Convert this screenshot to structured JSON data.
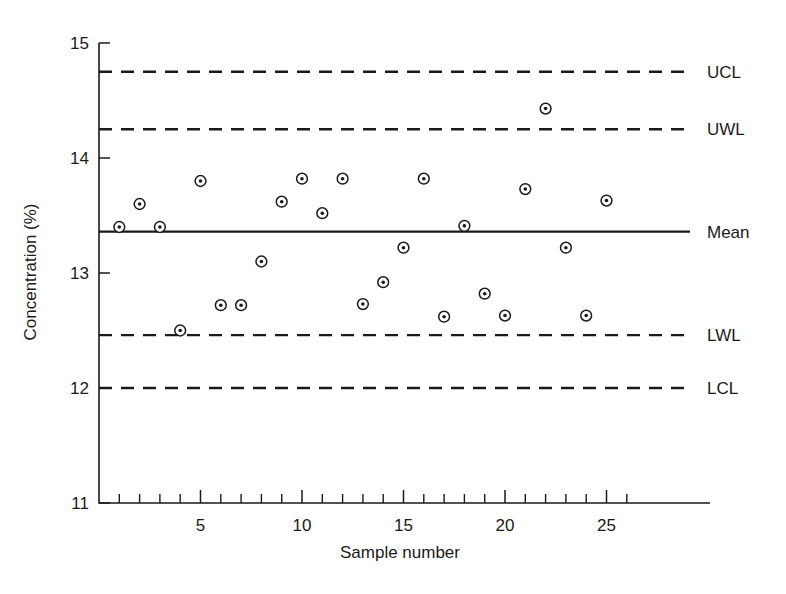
{
  "chart_data": {
    "type": "scatter",
    "title": "",
    "xlabel": "Sample number",
    "ylabel": "Concentration (%)",
    "xlim": [
      0,
      26
    ],
    "ylim": [
      11,
      15
    ],
    "xticks": [
      5,
      10,
      15,
      20,
      25
    ],
    "xtick_labels": [
      "5",
      "10",
      "15",
      "20",
      "25"
    ],
    "x_minor_tick_step": 1,
    "yticks": [
      11,
      12,
      13,
      14,
      15
    ],
    "ytick_labels": [
      "11",
      "12",
      "13",
      "14",
      "15"
    ],
    "grid": false,
    "legend": "none",
    "x": [
      1,
      2,
      3,
      4,
      5,
      6,
      7,
      8,
      9,
      10,
      11,
      12,
      13,
      14,
      15,
      16,
      17,
      18,
      19,
      20,
      21,
      22,
      23,
      24,
      25
    ],
    "values": [
      13.4,
      13.6,
      13.4,
      12.5,
      13.8,
      12.72,
      12.72,
      13.1,
      13.62,
      13.82,
      13.52,
      13.82,
      12.73,
      12.92,
      13.22,
      13.82,
      12.62,
      13.41,
      12.82,
      12.63,
      13.73,
      14.43,
      13.22,
      12.63,
      13.63
    ],
    "marker": "circle-with-dot",
    "reference_lines": [
      {
        "name": "UCL",
        "label": "UCL",
        "value": 14.75,
        "style": "dashed"
      },
      {
        "name": "UWL",
        "label": "UWL",
        "value": 14.25,
        "style": "dashed"
      },
      {
        "name": "Mean",
        "label": "Mean",
        "value": 13.36,
        "style": "solid"
      },
      {
        "name": "LWL",
        "label": "LWL",
        "value": 12.46,
        "style": "dashed"
      },
      {
        "name": "LCL",
        "label": "LCL",
        "value": 12.0,
        "style": "dashed"
      }
    ]
  },
  "axis": {
    "y_title": "Concentration (%)",
    "x_title": "Sample number"
  },
  "labels": {
    "ucl": "UCL",
    "uwl": "UWL",
    "mean": "Mean",
    "lwl": "LWL",
    "lcl": "LCL"
  },
  "colors": {
    "ink": "#1a1a1a",
    "background": "#ffffff"
  }
}
